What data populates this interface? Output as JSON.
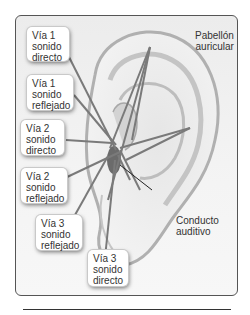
{
  "figure": {
    "title_labels": {
      "pinna": [
        "Pabellón",
        "auricular"
      ],
      "canal": [
        "Conducto",
        "auditivo"
      ]
    },
    "paths": [
      {
        "id": "via1-directo",
        "lines": [
          "Vía 1",
          "sonido",
          "directo"
        ]
      },
      {
        "id": "via1-reflejado",
        "lines": [
          "Vía 1",
          "sonido",
          "reflejado"
        ]
      },
      {
        "id": "via2-directo",
        "lines": [
          "Vía 2",
          "sonido",
          "directo"
        ]
      },
      {
        "id": "via2-reflejado",
        "lines": [
          "Vía 2",
          "sonido",
          "reflejado"
        ]
      },
      {
        "id": "via3-reflejado",
        "lines": [
          "Vía 3",
          "sonido",
          "reflejado"
        ]
      },
      {
        "id": "via3-directo",
        "lines": [
          "Vía 3",
          "sonido",
          "directo"
        ]
      }
    ],
    "colors": {
      "ray": "#7a7a7a",
      "ear_outline": "#9a9a9a",
      "canal": "#6b6b6b",
      "frame_border": "#555555"
    }
  }
}
